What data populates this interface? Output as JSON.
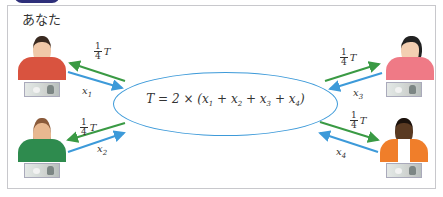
{
  "header": {
    "tab_text": "..."
  },
  "you_label": "あなた",
  "formula": {
    "lhs": "T",
    "text": "T = 2 × (x₁ + x₂ + x₃ + x₄)"
  },
  "share_label": {
    "num": "1",
    "den": "4",
    "var": "T"
  },
  "persons": [
    {
      "id": "person-1",
      "label": "x",
      "sub": "1",
      "shirt": "#d9533f",
      "skin": "#f0c8a8",
      "hair": "#3a2a20"
    },
    {
      "id": "person-2",
      "label": "x",
      "sub": "2",
      "shirt": "#2e8b4e",
      "skin": "#e8b890",
      "hair": "#8a5a3a"
    },
    {
      "id": "person-3",
      "label": "x",
      "sub": "3",
      "shirt": "#ef7a86",
      "skin": "#f3cfb2",
      "hair": "#222"
    },
    {
      "id": "person-4",
      "label": "x",
      "sub": "4",
      "shirt": "#f07e2a",
      "skin": "#5a3a22",
      "hair": "#1c120c"
    }
  ],
  "colors": {
    "green_arrow": "#3a9a44",
    "blue_arrow": "#3d9ad9",
    "ellipse": "#3d9ad9",
    "frame": "#c8c8cc"
  }
}
